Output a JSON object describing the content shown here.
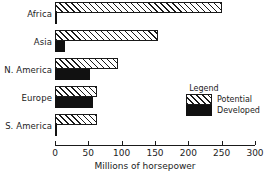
{
  "chart_data": {
    "type": "bar",
    "orientation": "horizontal",
    "title": "",
    "xlabel": "Millions of horsepower",
    "ylabel": "",
    "xlim": [
      0,
      300
    ],
    "xticks": [
      0,
      50,
      100,
      150,
      200,
      250,
      300
    ],
    "xtick_labels": [
      "0",
      "50",
      "100",
      "150",
      "200",
      "250",
      "300"
    ],
    "grid": false,
    "categories": [
      "Africa",
      "Asia",
      "N. America",
      "Europe",
      "S. America"
    ],
    "series": [
      {
        "name": "Potential",
        "values": [
          250,
          155,
          95,
          63,
          63
        ]
      },
      {
        "name": "Developed",
        "values": [
          3,
          15,
          52,
          57,
          3
        ]
      }
    ],
    "legend": {
      "title": "Legend",
      "position": "inside-right",
      "entries": [
        {
          "label": "Potential",
          "swatch": "hatched"
        },
        {
          "label": "Developed",
          "swatch": "solid-black"
        }
      ]
    },
    "colors": {
      "axis": "#1a1a1a",
      "potential_fill": "#ffffff",
      "potential_hatch": "#1a1a1a",
      "developed_fill": "#111111",
      "background": "#ffffff"
    }
  },
  "axis": {
    "title": "Millions of horsepower",
    "ticks": [
      {
        "value": 0,
        "label": "0"
      },
      {
        "value": 50,
        "label": "50"
      },
      {
        "value": 100,
        "label": "100"
      },
      {
        "value": 150,
        "label": "150"
      },
      {
        "value": 200,
        "label": "200"
      },
      {
        "value": 250,
        "label": "250"
      },
      {
        "value": 300,
        "label": "300"
      }
    ]
  },
  "categories": [
    {
      "label": "Africa",
      "potential": 250,
      "developed": 3
    },
    {
      "label": "Asia",
      "potential": 155,
      "developed": 15
    },
    {
      "label": "N. America",
      "potential": 95,
      "developed": 52
    },
    {
      "label": "Europe",
      "potential": 63,
      "developed": 57
    },
    {
      "label": "S. America",
      "potential": 63,
      "developed": 3
    }
  ],
  "legend": {
    "title": "Legend",
    "potential_label": "Potential",
    "developed_label": "Developed"
  }
}
